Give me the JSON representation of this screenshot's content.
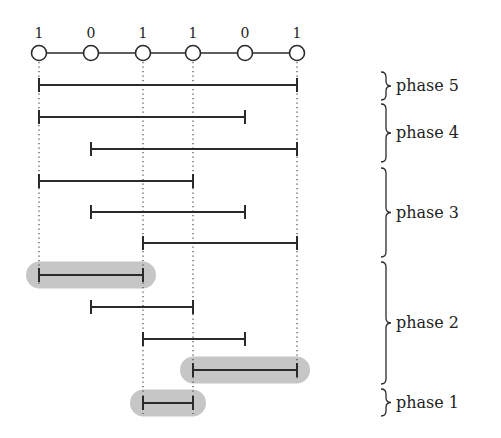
{
  "diagram": {
    "nodes": [
      {
        "x": 39,
        "label": "1"
      },
      {
        "x": 91,
        "label": "0"
      },
      {
        "x": 143,
        "label": "1"
      },
      {
        "x": 193,
        "label": "1"
      },
      {
        "x": 245,
        "label": "0"
      },
      {
        "x": 297,
        "label": "1"
      }
    ],
    "node_y": 53,
    "node_label_y": 38,
    "dotted_guides": [
      {
        "x": 39,
        "y1": 62,
        "y2": 286
      },
      {
        "x": 143,
        "y1": 62,
        "y2": 414
      },
      {
        "x": 193,
        "y1": 62,
        "y2": 414
      },
      {
        "x": 297,
        "y1": 62,
        "y2": 380
      }
    ],
    "intervals": [
      {
        "y": 85,
        "x1": 39,
        "x2": 297,
        "highlight": false,
        "phase": 5
      },
      {
        "y": 117,
        "x1": 39,
        "x2": 245,
        "highlight": false,
        "phase": 4
      },
      {
        "y": 149,
        "x1": 91,
        "x2": 297,
        "highlight": false,
        "phase": 4
      },
      {
        "y": 181,
        "x1": 39,
        "x2": 193,
        "highlight": false,
        "phase": 3
      },
      {
        "y": 212,
        "x1": 91,
        "x2": 245,
        "highlight": false,
        "phase": 3
      },
      {
        "y": 243,
        "x1": 143,
        "x2": 297,
        "highlight": false,
        "phase": 3
      },
      {
        "y": 275,
        "x1": 39,
        "x2": 143,
        "highlight": true,
        "phase": 2
      },
      {
        "y": 307,
        "x1": 91,
        "x2": 193,
        "highlight": false,
        "phase": 2
      },
      {
        "y": 339,
        "x1": 143,
        "x2": 245,
        "highlight": false,
        "phase": 2
      },
      {
        "y": 370,
        "x1": 193,
        "x2": 297,
        "highlight": true,
        "phase": 2
      },
      {
        "y": 403,
        "x1": 143,
        "x2": 193,
        "highlight": true,
        "phase": 1
      }
    ],
    "phases": [
      {
        "label": "phase 5",
        "y1": 72,
        "y2": 100
      },
      {
        "label": "phase 4",
        "y1": 104,
        "y2": 162
      },
      {
        "label": "phase 3",
        "y1": 168,
        "y2": 257
      },
      {
        "label": "phase 2",
        "y1": 262,
        "y2": 384
      },
      {
        "label": "phase 1",
        "y1": 389,
        "y2": 416
      }
    ],
    "colors": {
      "line": "#2a2a2a",
      "highlight": "#c6c6c6",
      "guide": "#555555",
      "node_fill": "#ffffff"
    }
  }
}
